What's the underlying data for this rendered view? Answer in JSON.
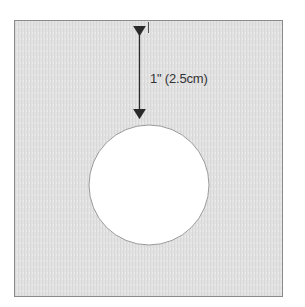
{
  "diagram": {
    "type": "template-cutout",
    "square": {
      "x": 14,
      "y": 20,
      "width": 269,
      "height": 277,
      "fill": "#e3e3e3",
      "stroke": "#8a8a8a"
    },
    "hole": {
      "cx": 149,
      "cy": 185,
      "r": 60,
      "fill": "#ffffff",
      "stroke": "#9a9a9a"
    },
    "dimension": {
      "label": "1\" (2.5cm)",
      "from_y": 21,
      "to_y": 124,
      "x": 139,
      "color": "#2a2a2a"
    }
  }
}
